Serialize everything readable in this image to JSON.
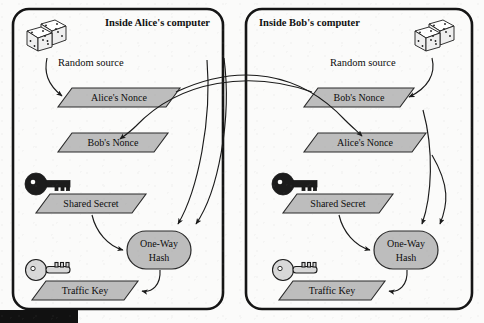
{
  "figure": {
    "type": "diagram",
    "background_color": "#fbfbfa",
    "shape_fill_color": "#bdbdbd",
    "stroke_color": "#1a1a1a"
  },
  "panels": [
    {
      "id": "alice",
      "title": "Inside Alice's computer",
      "title_align": "right",
      "random_source_label": "Random source",
      "random_source_icon": "dice-icon",
      "nodes": [
        {
          "id": "alice-nonce",
          "label": "Alice's Nonce",
          "shape": "parallelogram"
        },
        {
          "id": "bob-nonce",
          "label": "Bob's Nonce",
          "shape": "parallelogram"
        },
        {
          "id": "shared-secret",
          "label": "Shared Secret",
          "shape": "parallelogram",
          "icon": "dark-key-icon"
        },
        {
          "id": "one-way-hash",
          "label": "One-Way Hash",
          "label_line1": "One-Way",
          "label_line2": "Hash",
          "shape": "stadium"
        },
        {
          "id": "traffic-key",
          "label": "Traffic Key",
          "shape": "parallelogram",
          "icon": "light-key-icon"
        }
      ]
    },
    {
      "id": "bob",
      "title": "Inside Bob's computer",
      "title_align": "left",
      "random_source_label": "Random source",
      "random_source_icon": "dice-icon",
      "nodes": [
        {
          "id": "bob-nonce",
          "label": "Bob's Nonce",
          "shape": "parallelogram"
        },
        {
          "id": "alice-nonce",
          "label": "Alice's Nonce",
          "shape": "parallelogram"
        },
        {
          "id": "shared-secret",
          "label": "Shared Secret",
          "shape": "parallelogram",
          "icon": "dark-key-icon"
        },
        {
          "id": "one-way-hash",
          "label": "One-Way Hash",
          "label_line1": "One-Way",
          "label_line2": "Hash",
          "shape": "stadium"
        },
        {
          "id": "traffic-key",
          "label": "Traffic Key",
          "shape": "parallelogram",
          "icon": "light-key-icon"
        }
      ]
    }
  ],
  "flows": [
    {
      "from": "alice.random-source",
      "to": "alice.alice-nonce"
    },
    {
      "from": "bob.random-source",
      "to": "bob.bob-nonce"
    },
    {
      "from": "alice.alice-nonce",
      "to": "bob.alice-nonce",
      "crosses_panels": true
    },
    {
      "from": "bob.bob-nonce",
      "to": "alice.bob-nonce",
      "crosses_panels": true
    },
    {
      "from": "alice.alice-nonce",
      "to": "alice.one-way-hash"
    },
    {
      "from": "alice.bob-nonce",
      "to": "alice.one-way-hash"
    },
    {
      "from": "alice.shared-secret",
      "to": "alice.one-way-hash"
    },
    {
      "from": "alice.one-way-hash",
      "to": "alice.traffic-key"
    },
    {
      "from": "bob.bob-nonce",
      "to": "bob.one-way-hash"
    },
    {
      "from": "bob.alice-nonce",
      "to": "bob.one-way-hash"
    },
    {
      "from": "bob.shared-secret",
      "to": "bob.one-way-hash"
    },
    {
      "from": "bob.one-way-hash",
      "to": "bob.traffic-key"
    }
  ]
}
